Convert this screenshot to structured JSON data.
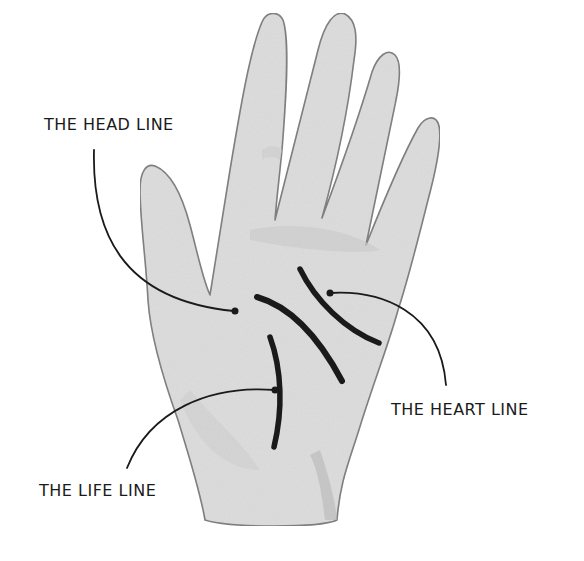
{
  "figure": {
    "colors": {
      "skin_fill": "#dcdcdc",
      "skin_shadow": "#c4c4c4",
      "outline": "#7a7a7a",
      "ink": "#1a1a1a",
      "background": "#ffffff"
    }
  },
  "labels": {
    "head_line": "THE HEAD LINE",
    "heart_line": "THE HEART LINE",
    "life_line": "THE LIFE LINE"
  }
}
